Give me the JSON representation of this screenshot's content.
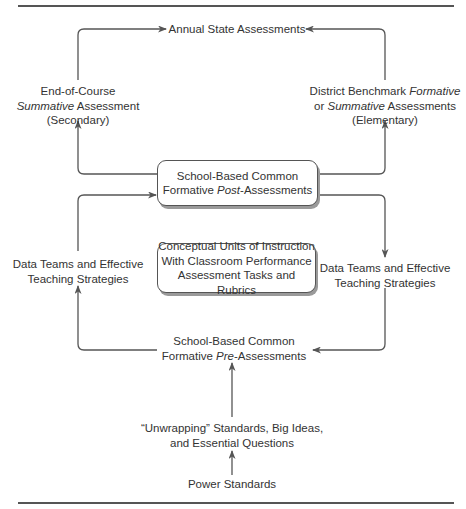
{
  "figure": {
    "title_partial": "Figure"
  },
  "nodes": {
    "annual_state": {
      "text": "Annual State Assessments"
    },
    "end_of_course": {
      "line1": "End-of-Course",
      "line2_italic": "Summative",
      "line2_rest": " Assessment",
      "line3": "(Secondary)"
    },
    "district_benchmark": {
      "line1_plain": "District Benchmark ",
      "line1_italic": "Formative",
      "line2_plain": "or ",
      "line2_italic": "Summative",
      "line2_rest": " Assessments",
      "line3": "(Elementary)"
    },
    "post_assessments": {
      "line1": "School-Based Common",
      "line2_plain": "Formative ",
      "line2_italic": "Post",
      "line2_rest": "-Assessments"
    },
    "data_teams_left": {
      "line1": "Data Teams and Effective",
      "line2": "Teaching Strategies"
    },
    "data_teams_right": {
      "line1": "Data Teams and Effective",
      "line2": "Teaching Strategies"
    },
    "conceptual_units": {
      "line1": "Conceptual Units of Instruction",
      "line2": "With Classroom Performance",
      "line3": "Assessment Tasks and Rubrics"
    },
    "pre_assessments": {
      "line1": "School-Based Common",
      "line2_plain": "Formative ",
      "line2_italic": "Pre",
      "line2_rest": "-Assessments"
    },
    "unwrapping": {
      "line1": "“Unwrapping” Standards, Big Ideas,",
      "line2": "and Essential Questions"
    },
    "power_standards": {
      "text": "Power Standards"
    }
  },
  "colors": {
    "line": "#555555",
    "text": "#333333",
    "shadow": "#9a9a9a"
  }
}
